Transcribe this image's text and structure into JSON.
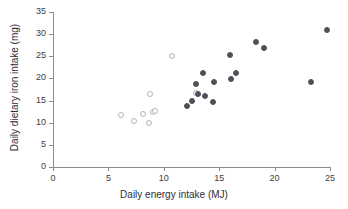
{
  "chart_data": {
    "type": "scatter",
    "title": "",
    "xlabel": "Daily energy intake (MJ)",
    "ylabel": "Daily dietary iron intake (mg)",
    "xlim": [
      0,
      25
    ],
    "ylim": [
      0,
      35
    ],
    "xticks": [
      0,
      5,
      10,
      15,
      20,
      25
    ],
    "yticks": [
      0,
      5,
      10,
      15,
      20,
      25,
      30,
      35
    ],
    "xtick_labels": [
      "0",
      "5",
      "10",
      "15",
      "20",
      "25"
    ],
    "ytick_labels": [
      "0",
      "5",
      "10",
      "15",
      "20",
      "25",
      "30",
      "35"
    ],
    "grid": false,
    "legend": "none",
    "marker_colors": {
      "filled": "#50505a",
      "open_edge": "#b4b4bb",
      "open_fill": "#ffffff",
      "axis": "#8b8b92",
      "text": "#2e2e34"
    },
    "series": [
      {
        "name": "open-markers",
        "marker": "open-circle",
        "points": [
          {
            "x": 6.15,
            "y": 11.7
          },
          {
            "x": 7.35,
            "y": 10.3
          },
          {
            "x": 8.1,
            "y": 11.9
          },
          {
            "x": 8.7,
            "y": 9.9
          },
          {
            "x": 8.75,
            "y": 16.4
          },
          {
            "x": 9.0,
            "y": 12.5
          },
          {
            "x": 9.25,
            "y": 12.6
          },
          {
            "x": 10.75,
            "y": 25.1
          },
          {
            "x": 12.9,
            "y": 16.6
          }
        ]
      },
      {
        "name": "filled-markers",
        "marker": "filled-circle",
        "points": [
          {
            "x": 12.05,
            "y": 13.8
          },
          {
            "x": 12.55,
            "y": 14.8
          },
          {
            "x": 12.95,
            "y": 18.8
          },
          {
            "x": 13.05,
            "y": 16.4
          },
          {
            "x": 13.55,
            "y": 21.2
          },
          {
            "x": 13.7,
            "y": 16.0
          },
          {
            "x": 14.4,
            "y": 14.6
          },
          {
            "x": 14.5,
            "y": 19.1
          },
          {
            "x": 15.95,
            "y": 25.3
          },
          {
            "x": 16.05,
            "y": 19.9
          },
          {
            "x": 16.55,
            "y": 21.3
          },
          {
            "x": 18.35,
            "y": 28.3
          },
          {
            "x": 19.0,
            "y": 26.8
          },
          {
            "x": 23.3,
            "y": 19.2
          },
          {
            "x": 24.7,
            "y": 31.0
          }
        ]
      }
    ]
  }
}
